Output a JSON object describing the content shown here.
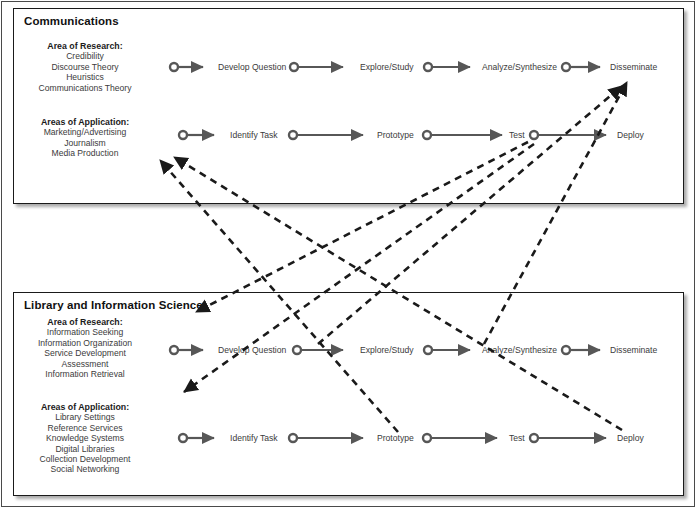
{
  "diagram": {
    "title_hidden": "",
    "colors": {
      "panel_border": "#1a1a1a",
      "page_border": "#4a4a4a",
      "arrow_solid": "#575757",
      "arrow_dashed": "#1a1a1a",
      "text": "#3b3b3b",
      "heading": "#111111",
      "background": "#ffffff"
    },
    "panels": [
      {
        "id": "communications",
        "title": "Communications",
        "research": {
          "heading": "Area of Research:",
          "items": [
            "Credibility",
            "Discourse Theory",
            "Heuristics",
            "Communications Theory"
          ]
        },
        "application": {
          "heading": "Areas of Application:",
          "items": [
            "Marketing/Advertising",
            "Journalism",
            "Media Production"
          ]
        },
        "research_flow": [
          "Develop Question",
          "Explore/Study",
          "Analyze/Synthesize",
          "Disseminate"
        ],
        "application_flow": [
          "Identify Task",
          "Prototype",
          "Test",
          "Deploy"
        ]
      },
      {
        "id": "library-and-information-science",
        "title": "Library and Information Science",
        "research": {
          "heading": "Area of Research:",
          "items": [
            "Information Seeking",
            "Information Organization",
            "Service Development",
            "Assessment",
            "Information Retrieval"
          ]
        },
        "application": {
          "heading": "Areas of Application:",
          "items": [
            "Library Settings",
            "Reference Services",
            "Knowledge Systems",
            "Digital Libraries",
            "Collection Development",
            "Social Networking"
          ]
        },
        "research_flow": [
          "Develop Question",
          "Explore/Study",
          "Analyze/Synthesize",
          "Disseminate"
        ],
        "application_flow": [
          "Identify Task",
          "Prototype",
          "Test",
          "Deploy"
        ]
      }
    ],
    "cross_links": [
      {
        "from": "lis-prototype",
        "to": "communications-application-areas",
        "style": "dashed",
        "direction": "up-left"
      },
      {
        "from": "lis-deploy",
        "to": "communications-application-areas",
        "style": "dashed",
        "direction": "up-left"
      },
      {
        "from": "communications-test",
        "to": "lis-title-area",
        "style": "dashed",
        "direction": "down-left"
      },
      {
        "from": "communications-test",
        "to": "lis-application-areas",
        "style": "dashed",
        "direction": "down-left"
      },
      {
        "from": "lis-analyze-synthesize",
        "to": "communications-disseminate",
        "style": "dashed",
        "direction": "up-right"
      },
      {
        "from": "lis-develop-question",
        "to": "communications-disseminate",
        "style": "dashed",
        "direction": "up-right"
      }
    ]
  }
}
